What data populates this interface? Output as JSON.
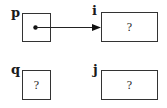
{
  "diagram": {
    "type": "pointer-diagram",
    "nodes": [
      {
        "id": "p",
        "label": "p",
        "value": "",
        "kind": "pointer",
        "points_to": "i"
      },
      {
        "id": "i",
        "label": "i",
        "value": "?",
        "kind": "variable"
      },
      {
        "id": "q",
        "label": "q",
        "value": "?",
        "kind": "pointer"
      },
      {
        "id": "j",
        "label": "j",
        "value": "?",
        "kind": "variable"
      }
    ],
    "edges": [
      {
        "from": "p",
        "to": "i",
        "style": "arrow"
      }
    ]
  }
}
